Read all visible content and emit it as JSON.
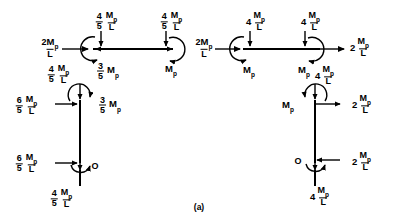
{
  "figure": {
    "caption": "(a)",
    "line_color": "#000000",
    "background": "#ffffff",
    "symbols": {
      "mp": "M",
      "mp_sub": "p",
      "length": "L",
      "zero": "O"
    }
  },
  "beam_left": {
    "name": "left beam free body",
    "left_reaction": {
      "coef": "2",
      "numerator": "M",
      "sub": "p",
      "denominator": "L",
      "text": "2Mp/L",
      "direction": "right"
    },
    "node_a": {
      "vertical_force": {
        "num": "4",
        "den": "5",
        "value": "Mp/L",
        "text": "4/5 Mp/L",
        "direction": "down"
      },
      "horizontal_force": {
        "direction": "left"
      },
      "moment": {
        "num": "3",
        "den": "5",
        "value": "Mp",
        "text": "3/5 Mp",
        "sense": "counterclockwise"
      }
    },
    "node_b": {
      "vertical_force": {
        "num": "4",
        "den": "5",
        "value": "Mp/L",
        "text": "4/5 Mp/L",
        "direction": "down"
      },
      "horizontal_force": {
        "direction": "right"
      },
      "moment": {
        "value": "Mp",
        "text": "Mp",
        "sense": "clockwise"
      }
    }
  },
  "beam_right": {
    "name": "right beam free body",
    "left_reaction": {
      "coef": "2",
      "numerator": "M",
      "sub": "p",
      "denominator": "L",
      "text": "2Mp/L",
      "direction": "right"
    },
    "right_reaction": {
      "coef": "2",
      "numerator": "M",
      "sub": "p",
      "denominator": "L",
      "text": "2Mp/L",
      "direction": "right"
    },
    "node_a": {
      "vertical_force": {
        "coef": "4",
        "value": "Mp/L",
        "text": "4 Mp/L",
        "direction": "down"
      },
      "moment": {
        "value": "Mp",
        "text": "Mp",
        "sense": "counterclockwise"
      }
    },
    "node_b": {
      "vertical_force": {
        "coef": "4",
        "value": "Mp/L",
        "text": "4 Mp/L",
        "direction": "down"
      },
      "moment": {
        "value": "Mp",
        "text": "Mp",
        "sense": "clockwise"
      }
    }
  },
  "column_left": {
    "name": "left column free body",
    "top_axial": {
      "num": "4",
      "den": "5",
      "value": "Mp/L",
      "text": "4/5 Mp/L",
      "direction": "down"
    },
    "top_shear": {
      "num": "6",
      "den": "5",
      "value": "Mp/L",
      "text": "6/5 Mp/L",
      "direction": "right"
    },
    "top_moment": {
      "num": "3",
      "den": "5",
      "value": "Mp",
      "text": "3/5 Mp",
      "sense": "clockwise"
    },
    "bottom_shear": {
      "num": "6",
      "den": "5",
      "value": "Mp/L",
      "text": "6/5 Mp/L",
      "direction": "right"
    },
    "bottom_moment": {
      "value": "O",
      "text": "O",
      "sense": "zero"
    },
    "bottom_axial": {
      "num": "4",
      "den": "5",
      "value": "Mp/L",
      "text": "4/5 Mp/L",
      "direction": "down"
    }
  },
  "column_right": {
    "name": "right column free body",
    "top_axial": {
      "coef": "4",
      "value": "Mp/L",
      "text": "4 Mp/L",
      "direction": "down"
    },
    "top_shear": {
      "coef": "2",
      "value": "Mp/L",
      "text": "2 Mp/L",
      "direction": "right"
    },
    "top_moment": {
      "value": "Mp",
      "text": "Mp",
      "sense": "counterclockwise"
    },
    "bottom_shear": {
      "coef": "2",
      "value": "Mp/L",
      "text": "2 Mp/L",
      "direction": "left"
    },
    "bottom_moment": {
      "value": "O",
      "text": "O",
      "sense": "zero"
    },
    "bottom_axial": {
      "coef": "4",
      "value": "Mp/L",
      "text": "4 Mp/L",
      "direction": "down"
    }
  }
}
